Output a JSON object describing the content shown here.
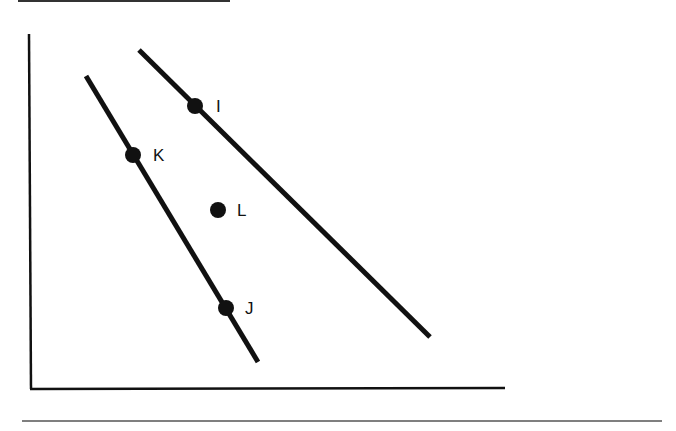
{
  "figure": {
    "type": "diagram",
    "colors": {
      "background": "#ffffff",
      "ink": "#111111",
      "rule": "#555555"
    }
  },
  "rules": {
    "top": {
      "x1": 18,
      "y1": 1,
      "x2": 230,
      "y2": 1
    },
    "bottom": {
      "x1": 22,
      "y1": 421,
      "x2": 662,
      "y2": 421
    }
  },
  "axes": {
    "origin": {
      "x": 31,
      "y": 389
    },
    "y_axis_top": {
      "x": 29,
      "y": 34
    },
    "x_axis_right": {
      "x": 505,
      "y": 388
    },
    "xlabel": "",
    "ylabel": ""
  },
  "lines": [
    {
      "name": "left-line",
      "x1": 86,
      "y1": 76,
      "x2": 258,
      "y2": 362
    },
    {
      "name": "right-line",
      "x1": 139,
      "y1": 50,
      "x2": 430,
      "y2": 337
    }
  ],
  "points": [
    {
      "id": "I",
      "label": "I",
      "x": 195,
      "y": 106,
      "label_x": 216,
      "label_y": 112
    },
    {
      "id": "K",
      "label": "K",
      "x": 133,
      "y": 155,
      "label_x": 153,
      "label_y": 161
    },
    {
      "id": "L",
      "label": "L",
      "x": 218,
      "y": 210,
      "label_x": 237,
      "label_y": 216
    },
    {
      "id": "J",
      "label": "J",
      "x": 226,
      "y": 308,
      "label_x": 245,
      "label_y": 314
    }
  ]
}
